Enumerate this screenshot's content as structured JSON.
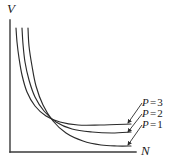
{
  "figure": {
    "background_color": "#ffffff",
    "line_color": "#2b2b2b",
    "axis_color": "#3a3a3a"
  },
  "axes": {
    "y_label": "V",
    "x_label": "N",
    "origin_px": [
      10,
      152
    ],
    "x_end_px": [
      136,
      152
    ],
    "y_end_px": [
      10,
      20
    ]
  },
  "annotations": [
    {
      "name": "arrow-to-p3",
      "from_px": [
        142,
        103
      ],
      "to_px": [
        128,
        123
      ]
    },
    {
      "name": "arrow-to-p2",
      "from_px": [
        142,
        114
      ],
      "to_px": [
        128,
        132
      ]
    },
    {
      "name": "arrow-to-p1",
      "from_px": [
        142,
        125
      ],
      "to_px": [
        128,
        145
      ]
    }
  ],
  "chart_data": {
    "type": "line",
    "title": "",
    "xlabel": "N",
    "ylabel": "V",
    "grid": false,
    "legend_position": "right-inline-annotations",
    "xlim": [
      0,
      1
    ],
    "ylim": [
      0,
      1
    ],
    "series": [
      {
        "name": "P = 3",
        "label_symbol": "P",
        "label_equals": "=",
        "label_value": "3",
        "points_px": [
          [
            16,
            28
          ],
          [
            17,
            42
          ],
          [
            19,
            58
          ],
          [
            22,
            75
          ],
          [
            27,
            92
          ],
          [
            35,
            106
          ],
          [
            46,
            116
          ],
          [
            60,
            122
          ],
          [
            78,
            125
          ],
          [
            100,
            125
          ],
          [
            131,
            124
          ]
        ]
      },
      {
        "name": "P = 2",
        "label_symbol": "P",
        "label_equals": "=",
        "label_value": "2",
        "points_px": [
          [
            22,
            28
          ],
          [
            23,
            44
          ],
          [
            25,
            62
          ],
          [
            29,
            80
          ],
          [
            35,
            97
          ],
          [
            44,
            111
          ],
          [
            56,
            122
          ],
          [
            72,
            129
          ],
          [
            92,
            132
          ],
          [
            112,
            133
          ],
          [
            131,
            132
          ]
        ]
      },
      {
        "name": "P = 1",
        "label_symbol": "P",
        "label_equals": "=",
        "label_value": "1",
        "points_px": [
          [
            28,
            28
          ],
          [
            29,
            46
          ],
          [
            32,
            66
          ],
          [
            36,
            86
          ],
          [
            43,
            105
          ],
          [
            53,
            121
          ],
          [
            66,
            133
          ],
          [
            83,
            141
          ],
          [
            101,
            145
          ],
          [
            117,
            146
          ],
          [
            131,
            146
          ]
        ]
      }
    ]
  }
}
